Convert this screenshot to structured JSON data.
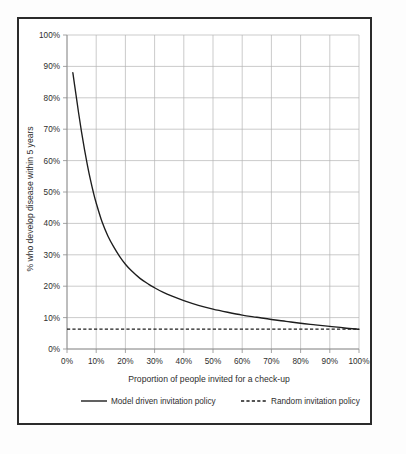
{
  "chart_data": {
    "type": "line",
    "title": "",
    "xlabel": "Proportion of people invited for a check-up",
    "ylabel": "% who develop disease within 5 years",
    "xlim": [
      0,
      100
    ],
    "ylim": [
      0,
      100
    ],
    "grid": true,
    "legend_position": "bottom",
    "x_tick_labels": [
      "0%",
      "10%",
      "20%",
      "30%",
      "40%",
      "50%",
      "60%",
      "70%",
      "80%",
      "90%",
      "100%"
    ],
    "x_tick_values": [
      0,
      10,
      20,
      30,
      40,
      50,
      60,
      70,
      80,
      90,
      100
    ],
    "y_tick_labels": [
      "0%",
      "10%",
      "20%",
      "30%",
      "40%",
      "50%",
      "60%",
      "70%",
      "80%",
      "90%",
      "100%"
    ],
    "y_tick_values": [
      0,
      10,
      20,
      30,
      40,
      50,
      60,
      70,
      80,
      90,
      100
    ],
    "series": [
      {
        "name": "Model driven invitation policy",
        "style": "solid",
        "color": "#1d1d1d",
        "x": [
          2,
          3,
          4,
          5,
          6,
          7,
          8,
          9,
          10,
          12,
          14,
          16,
          18,
          20,
          22,
          25,
          28,
          30,
          33,
          36,
          40,
          45,
          50,
          55,
          60,
          65,
          70,
          75,
          80,
          85,
          90,
          95,
          100
        ],
        "values": [
          88.0,
          81.5,
          75.0,
          69.0,
          63.5,
          58.5,
          54.0,
          50.0,
          46.5,
          40.5,
          36.0,
          32.5,
          29.5,
          27.0,
          25.0,
          22.5,
          20.6,
          19.5,
          18.0,
          16.8,
          15.4,
          13.9,
          12.7,
          11.7,
          10.8,
          10.1,
          9.4,
          8.8,
          8.2,
          7.7,
          7.2,
          6.7,
          6.3
        ]
      },
      {
        "name": "Random invitation policy",
        "style": "dashed",
        "color": "#1d1d1d",
        "x": [
          0,
          100
        ],
        "values": [
          6.3,
          6.3
        ]
      }
    ]
  },
  "legend": {
    "entries": [
      {
        "label": "Model driven invitation policy",
        "style": "solid"
      },
      {
        "label": "Random invitation policy",
        "style": "dashed"
      }
    ]
  }
}
